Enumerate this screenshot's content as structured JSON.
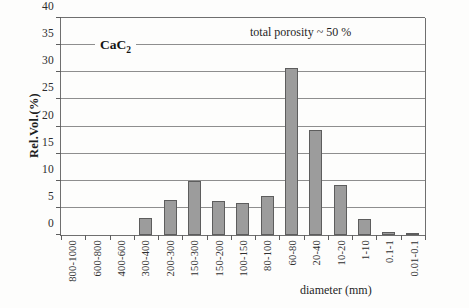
{
  "chart_data": {
    "type": "bar",
    "title": "",
    "series_label": "CaC",
    "series_label_sub": "2",
    "annotation": "total porosity ~ 50 %",
    "xlabel": "diameter (mm)",
    "ylabel": "Rel.Vol.(%)",
    "ylim": [
      0,
      40
    ],
    "yticks": [
      0,
      5,
      10,
      15,
      20,
      25,
      30,
      35,
      40
    ],
    "ytick_labels": [
      "0",
      "5",
      "10",
      "15",
      "20",
      "25",
      "30",
      "35",
      "40"
    ],
    "grid": true,
    "legend_position": "none",
    "bar_color": "#9c9c9c",
    "bar_edge_color": "#5d5d5d",
    "categories": [
      "800-1000",
      "600-800",
      "400-600",
      "300-400",
      "200-300",
      "150-300",
      "150-200",
      "100-150",
      "80-100",
      "60-80",
      "20-40",
      "10-20",
      "1-10",
      "0.1-1",
      "0.01-0.1"
    ],
    "values": [
      0,
      0,
      0,
      3.1,
      6.4,
      10.0,
      6.3,
      5.9,
      7.2,
      30.8,
      19.4,
      9.2,
      3.0,
      0.5,
      0.1
    ]
  }
}
